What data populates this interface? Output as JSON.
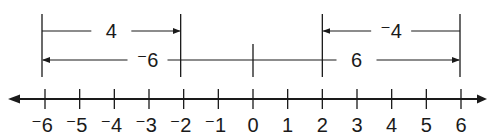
{
  "diagram": {
    "colors": {
      "ink": "#1a1a1a",
      "background": "#ffffff"
    },
    "number_line": {
      "min": -6,
      "max": 6,
      "tick_labels": [
        "⁻6",
        "⁻5",
        "⁻4",
        "⁻3",
        "⁻2",
        "⁻1",
        "0",
        "1",
        "2",
        "3",
        "4",
        "5",
        "6"
      ],
      "arrows_both_ends": true
    },
    "vectors": [
      {
        "label": "4",
        "from": -6,
        "to": -2,
        "row": "top"
      },
      {
        "label": "⁻6",
        "from": 0,
        "to": -6,
        "row": "bottom"
      },
      {
        "label": "⁻4",
        "from": 6,
        "to": 2,
        "row": "top"
      },
      {
        "label": "6",
        "from": 0,
        "to": 6,
        "row": "bottom"
      }
    ],
    "markers": [
      {
        "at": -6,
        "type": "tall"
      },
      {
        "at": -2,
        "type": "tall"
      },
      {
        "at": 0,
        "type": "short"
      },
      {
        "at": 2,
        "type": "tall"
      },
      {
        "at": 6,
        "type": "tall"
      }
    ]
  }
}
